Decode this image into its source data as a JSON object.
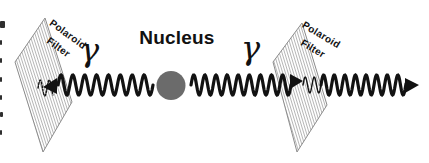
{
  "diagram": {
    "title": "Nucleus",
    "gamma_left": "γ",
    "gamma_right": "γ",
    "filter_left_label_line1": "Polaroid",
    "filter_left_label_line2": "Filter",
    "filter_right_label_line1": "Polaroid",
    "filter_right_label_line2": "Filter",
    "colors": {
      "background": "#ffffff",
      "wave": "#121212",
      "nucleus": "#6b6b6b",
      "filter_fill": "#ffffff",
      "filter_outline": "#8c8c8c",
      "filter_hatch": "#a2a2a2",
      "label": "#111111",
      "edge_fragment": "#2f2f2f"
    },
    "nucleus_circle": {
      "cx": 171,
      "cy": 85.5,
      "r": 14.5
    },
    "filters": [
      {
        "name": "left-polaroid-filter",
        "points": [
          [
            45,
            18
          ],
          [
            72,
            102
          ],
          [
            43,
            152
          ],
          [
            15,
            62
          ]
        ],
        "hatch_step": 2.7
      },
      {
        "name": "right-polaroid-filter",
        "points": [
          [
            302,
            23
          ],
          [
            327,
            105
          ],
          [
            297,
            152
          ],
          [
            273,
            62
          ]
        ],
        "hatch_step": 2.7
      }
    ],
    "waves": [
      {
        "name": "left-photon-wave",
        "x1": 58,
        "x2": 153,
        "cy": 85,
        "amp": 10,
        "wavelength": 11.875,
        "stroke": 3.2,
        "dashed": false
      },
      {
        "name": "left-filter-polarized-squiggle",
        "x1": 38,
        "x2": 53,
        "cy": 88,
        "amp": 8,
        "wavelength": 9,
        "stroke": 1.4,
        "dashed": true
      },
      {
        "name": "right-photon-wave-before-filter",
        "x1": 191,
        "x2": 291,
        "cy": 85,
        "amp": 10,
        "wavelength": 11.11,
        "stroke": 3.2,
        "dashed": false
      },
      {
        "name": "right-filter-polarized-squiggle",
        "x1": 303,
        "x2": 321,
        "cy": 85,
        "amp": 8,
        "wavelength": 9,
        "stroke": 1.4,
        "dashed": false
      },
      {
        "name": "right-photon-wave-after-filter",
        "x1": 321,
        "x2": 406,
        "cy": 85,
        "amp": 10,
        "wavelength": 10.6,
        "stroke": 3.2,
        "dashed": false
      }
    ],
    "arrows": [
      {
        "name": "left-photon-direction-arrowhead",
        "tip": [
          43,
          87
        ],
        "base": [
          [
            57,
            78
          ],
          [
            57,
            94
          ]
        ]
      },
      {
        "name": "right-photon-mid-arrowhead",
        "tip": [
          303,
          81
        ],
        "base": [
          [
            290,
            74
          ],
          [
            290,
            89
          ]
        ]
      },
      {
        "name": "right-photon-end-arrowhead",
        "tip": [
          419,
          85
        ],
        "base": [
          [
            405,
            78
          ],
          [
            405,
            93
          ]
        ]
      }
    ],
    "edge_fragments": [
      [
        0,
        21,
        5,
        7
      ],
      [
        0,
        40,
        2,
        5
      ],
      [
        0,
        58,
        2,
        5
      ],
      [
        0,
        77,
        2,
        5
      ],
      [
        0,
        95,
        2,
        5
      ],
      [
        0,
        112,
        3,
        5
      ],
      [
        0,
        130,
        2,
        5
      ]
    ]
  }
}
